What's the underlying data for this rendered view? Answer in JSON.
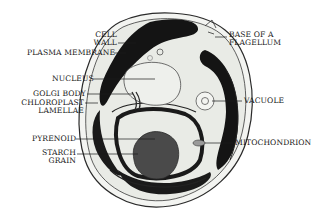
{
  "diagram": {
    "colors": {
      "ink": "#1a1a1a",
      "cytoplasm": "#e9ebe6",
      "pyrenoid": "#4a4a4a",
      "background": "#ffffff"
    },
    "labels": {
      "cell_wall": [
        "CELL",
        "WALL"
      ],
      "plasma_membrane": "PLASMA MEMBRANE",
      "nucleus": "NUCLEUS",
      "golgi_body": "GOLGI BODY",
      "chloroplast_lamellae": [
        "CHLOROPLAST",
        "LAMELLAE"
      ],
      "pyrenoid": "PYRENOID",
      "starch_grain": [
        "STARCH",
        "GRAIN"
      ],
      "base_of_flagellum": [
        "BASE OF A",
        "FLAGELLUM"
      ],
      "vacuole": "VACUOLE",
      "mitochondrion": "MITOCHONDRION"
    }
  }
}
